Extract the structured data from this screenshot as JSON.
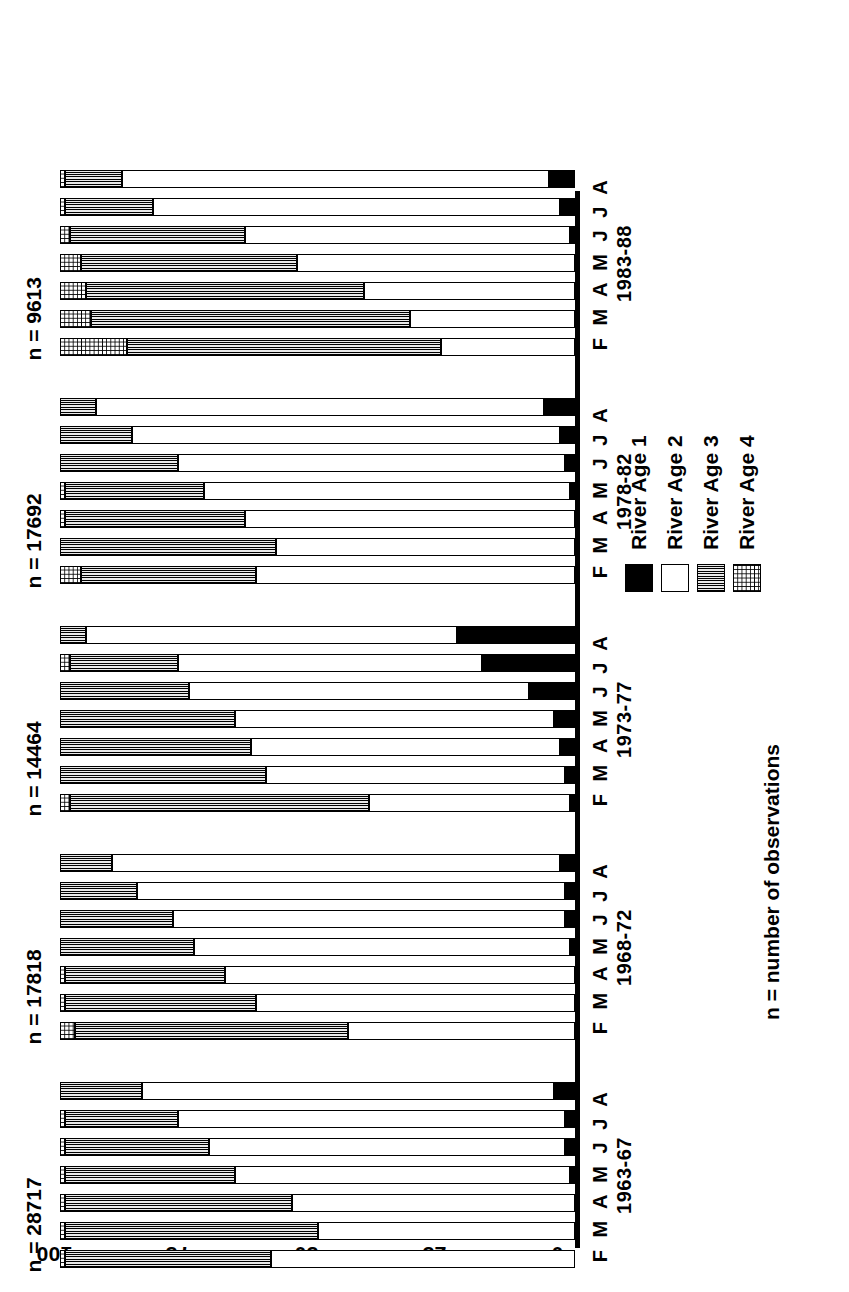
{
  "chart": {
    "type": "bar",
    "title": "",
    "ylabel": "Percentage composition",
    "xlabel": "",
    "footnote": "n = number of observations",
    "axis": {
      "ticks": [
        "0",
        "25",
        "50",
        "75",
        "100"
      ],
      "min": 0,
      "max": 100
    },
    "months": "F M A M J J A",
    "legend": [
      {
        "label": "River Age 1",
        "key": "age1",
        "fill": "solid-black",
        "color": "#000000"
      },
      {
        "label": "River Age 2",
        "key": "age2",
        "fill": "white",
        "color": "#ffffff"
      },
      {
        "label": "River Age 3",
        "key": "age3",
        "fill": "dense-vertical-hatch",
        "color": "#6d6d6d"
      },
      {
        "label": "River Age 4",
        "key": "age4",
        "fill": "light-dotted",
        "color": "#d9d9d9"
      }
    ],
    "groups": [
      {
        "period": "1963-67",
        "n_label": "n = 28717",
        "n": 28717,
        "months": [
          "F",
          "M",
          "A",
          "M",
          "J",
          "J",
          "A"
        ],
        "bars": [
          {
            "month": "F",
            "age1": 0,
            "age2": 59,
            "age3": 40,
            "age4": 1
          },
          {
            "month": "M",
            "age1": 0,
            "age2": 50,
            "age3": 49,
            "age4": 1
          },
          {
            "month": "A",
            "age1": 0,
            "age2": 55,
            "age3": 44,
            "age4": 1
          },
          {
            "month": "M",
            "age1": 1,
            "age2": 65,
            "age3": 33,
            "age4": 1
          },
          {
            "month": "J",
            "age1": 2,
            "age2": 69,
            "age3": 28,
            "age4": 1
          },
          {
            "month": "J",
            "age1": 2,
            "age2": 75,
            "age3": 22,
            "age4": 1
          },
          {
            "month": "A",
            "age1": 4,
            "age2": 80,
            "age3": 16,
            "age4": 0
          }
        ]
      },
      {
        "period": "1968-72",
        "n_label": "n = 17818",
        "n": 17818,
        "months": [
          "F",
          "M",
          "A",
          "M",
          "J",
          "J",
          "A"
        ],
        "bars": [
          {
            "month": "F",
            "age1": 0,
            "age2": 44,
            "age3": 53,
            "age4": 3
          },
          {
            "month": "M",
            "age1": 0,
            "age2": 62,
            "age3": 37,
            "age4": 1
          },
          {
            "month": "A",
            "age1": 0,
            "age2": 68,
            "age3": 31,
            "age4": 1
          },
          {
            "month": "M",
            "age1": 1,
            "age2": 73,
            "age3": 26,
            "age4": 0
          },
          {
            "month": "J",
            "age1": 2,
            "age2": 76,
            "age3": 22,
            "age4": 0
          },
          {
            "month": "J",
            "age1": 2,
            "age2": 83,
            "age3": 15,
            "age4": 0
          },
          {
            "month": "A",
            "age1": 3,
            "age2": 87,
            "age3": 10,
            "age4": 0
          }
        ]
      },
      {
        "period": "1973-77",
        "n_label": "n = 14464",
        "n": 14464,
        "months": [
          "F",
          "M",
          "A",
          "M",
          "J",
          "J",
          "A"
        ],
        "bars": [
          {
            "month": "F",
            "age1": 1,
            "age2": 39,
            "age3": 58,
            "age4": 2
          },
          {
            "month": "M",
            "age1": 2,
            "age2": 58,
            "age3": 40,
            "age4": 0
          },
          {
            "month": "A",
            "age1": 3,
            "age2": 60,
            "age3": 37,
            "age4": 0
          },
          {
            "month": "M",
            "age1": 4,
            "age2": 62,
            "age3": 34,
            "age4": 0
          },
          {
            "month": "J",
            "age1": 9,
            "age2": 66,
            "age3": 25,
            "age4": 0
          },
          {
            "month": "J",
            "age1": 18,
            "age2": 59,
            "age3": 21,
            "age4": 2
          },
          {
            "month": "A",
            "age1": 23,
            "age2": 72,
            "age3": 5,
            "age4": 0
          }
        ]
      },
      {
        "period": "1978-82",
        "n_label": "n = 17692",
        "n": 17692,
        "months": [
          "F",
          "M",
          "A",
          "M",
          "J",
          "J",
          "A"
        ],
        "bars": [
          {
            "month": "F",
            "age1": 0,
            "age2": 62,
            "age3": 34,
            "age4": 4
          },
          {
            "month": "M",
            "age1": 0,
            "age2": 58,
            "age3": 42,
            "age4": 0
          },
          {
            "month": "A",
            "age1": 0,
            "age2": 64,
            "age3": 35,
            "age4": 1
          },
          {
            "month": "M",
            "age1": 1,
            "age2": 71,
            "age3": 27,
            "age4": 1
          },
          {
            "month": "J",
            "age1": 2,
            "age2": 75,
            "age3": 23,
            "age4": 0
          },
          {
            "month": "J",
            "age1": 3,
            "age2": 83,
            "age3": 14,
            "age4": 0
          },
          {
            "month": "A",
            "age1": 6,
            "age2": 87,
            "age3": 7,
            "age4": 0
          }
        ]
      },
      {
        "period": "1983-88",
        "n_label": "n = 9613",
        "n": 9613,
        "months": [
          "F",
          "M",
          "A",
          "M",
          "J",
          "J",
          "A"
        ],
        "bars": [
          {
            "month": "F",
            "age1": 0,
            "age2": 26,
            "age3": 61,
            "age4": 13
          },
          {
            "month": "M",
            "age1": 0,
            "age2": 32,
            "age3": 62,
            "age4": 6
          },
          {
            "month": "A",
            "age1": 0,
            "age2": 41,
            "age3": 54,
            "age4": 5
          },
          {
            "month": "M",
            "age1": 0,
            "age2": 54,
            "age3": 42,
            "age4": 4
          },
          {
            "month": "J",
            "age1": 1,
            "age2": 63,
            "age3": 34,
            "age4": 2
          },
          {
            "month": "J",
            "age1": 3,
            "age2": 79,
            "age3": 17,
            "age4": 1
          },
          {
            "month": "A",
            "age1": 5,
            "age2": 83,
            "age3": 11,
            "age4": 1
          }
        ]
      }
    ]
  }
}
